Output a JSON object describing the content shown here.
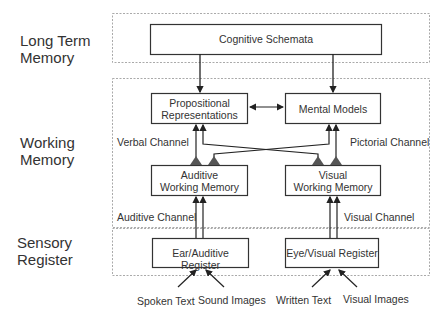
{
  "layers": {
    "long_term": {
      "line1": "Long Term",
      "line2": "Memory"
    },
    "working": {
      "line1": "Working",
      "line2": "Memory"
    },
    "sensory": {
      "line1": "Sensory",
      "line2": "Register"
    }
  },
  "boxes": {
    "cognitive_schemata": "Cognitive Schemata",
    "propositional_line1": "Propositional",
    "propositional_line2": "Representations",
    "mental_models": "Mental Models",
    "auditive_wm_line1": "Auditive",
    "auditive_wm_line2": "Working Memory",
    "visual_wm_line1": "Visual",
    "visual_wm_line2": "Working Memory",
    "ear_register": "Ear/Auditive Register",
    "eye_register": "Eye/Visual Register"
  },
  "channels": {
    "verbal": "Verbal Channel",
    "pictorial": "Pictorial Channel",
    "auditive": "Auditive Channel",
    "visual": "Visual Channel"
  },
  "inputs": [
    "Spoken Text",
    "Sound Images",
    "Written Text",
    "Visual Images"
  ],
  "colors": {
    "line": "#222222",
    "dashed": "#aaaaaa",
    "triangle": "#555555"
  }
}
